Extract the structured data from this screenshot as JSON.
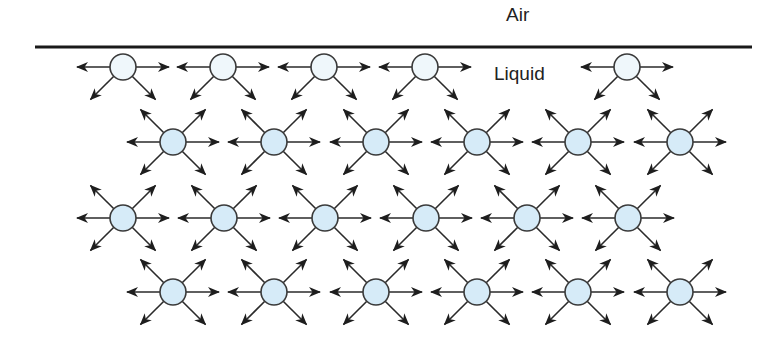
{
  "labels": {
    "air": "Air",
    "liquid": "Liquid"
  },
  "colors": {
    "surface_line": "#1a1a1a",
    "arrow": "#2a2a2a",
    "molecule_stroke": "#3a3a3a",
    "surface_molecule_fill": "#eff7fb",
    "bulk_molecule_fill": "#d6ebf8"
  },
  "surface": {
    "x1": 35,
    "x2": 752,
    "y": 47
  },
  "molecule_radius": 13,
  "rows": [
    {
      "name": "surface-row",
      "type": "surface",
      "y": 67,
      "xs": [
        123,
        223,
        324,
        425,
        627
      ]
    },
    {
      "name": "bulk-row-1",
      "type": "bulk",
      "y": 142,
      "xs": [
        173,
        274,
        376,
        477,
        578,
        680
      ]
    },
    {
      "name": "bulk-row-2",
      "type": "bulk",
      "y": 218,
      "xs": [
        123,
        224,
        325,
        426,
        527,
        628
      ]
    },
    {
      "name": "bulk-row-3",
      "type": "bulk",
      "y": 292,
      "xs": [
        173,
        274,
        376,
        477,
        578,
        680
      ]
    }
  ],
  "forces": {
    "surface": [
      "left",
      "right",
      "down-left",
      "down-right"
    ],
    "bulk": [
      "left",
      "right",
      "up-left",
      "up-right",
      "down-left",
      "down-right"
    ]
  }
}
